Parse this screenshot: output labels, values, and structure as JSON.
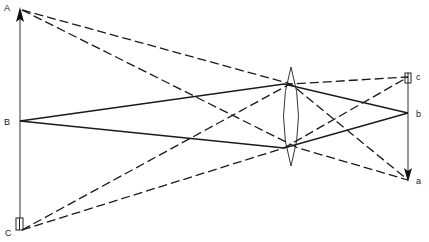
{
  "diagram": {
    "type": "lens ray diagram",
    "object_labels": {
      "top": "A",
      "middle": "B",
      "bottom": "C"
    },
    "image_labels": {
      "top": "c",
      "middle": "b",
      "bottom": "a"
    },
    "colors": {
      "line": "#1a1a1a",
      "background": "#ffffff"
    },
    "object": {
      "x": 20,
      "A_y": 10,
      "B_y": 121,
      "C_y": 230
    },
    "lens": {
      "x": 291,
      "top_y": 67,
      "bottom_y": 166,
      "upper_node_y": 84,
      "lower_node_y": 148
    },
    "image": {
      "x": 408,
      "c_y": 77,
      "b_y": 113,
      "a_y": 180
    }
  }
}
